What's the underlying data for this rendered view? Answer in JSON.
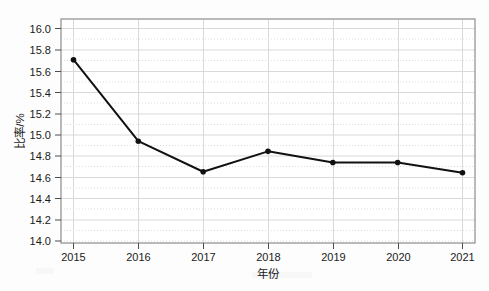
{
  "chart_data": {
    "type": "line",
    "title": "",
    "xlabel": "年份",
    "ylabel": "比率/%",
    "categories": [
      "2015",
      "2016",
      "2017",
      "2018",
      "2019",
      "2020",
      "2021"
    ],
    "x": [
      2015,
      2016,
      2017,
      2018,
      2019,
      2020,
      2021
    ],
    "values": [
      15.7,
      14.9,
      14.6,
      14.8,
      14.69,
      14.69,
      14.59
    ],
    "series": [
      {
        "name": "比率/%",
        "values": [
          15.7,
          14.9,
          14.6,
          14.8,
          14.69,
          14.69,
          14.59
        ]
      }
    ],
    "ylim": [
      13.9,
      16.1
    ],
    "xlim": [
      2014.8,
      2021.2
    ],
    "ytick_labels": [
      "14.0",
      "14.2",
      "14.4",
      "14.6",
      "14.8",
      "15.0",
      "15.2",
      "15.4",
      "15.6",
      "15.8",
      "16.0"
    ],
    "ytick_values": [
      14.0,
      14.2,
      14.4,
      14.6,
      14.8,
      15.0,
      15.2,
      15.4,
      15.6,
      15.8,
      16.0
    ],
    "xtick_labels": [
      "2015",
      "2016",
      "2017",
      "2018",
      "2019",
      "2020",
      "2021"
    ],
    "grid": "major-solid-minor-dotted",
    "legend": "none",
    "marker": "filled-circle",
    "line_color": "#111111",
    "grid_color": "#d9d9d9",
    "border_color": "#8c8c8c",
    "background_color": "#fdfdfd"
  },
  "axes": {
    "y_title": "比率/%",
    "x_title": "年份"
  }
}
